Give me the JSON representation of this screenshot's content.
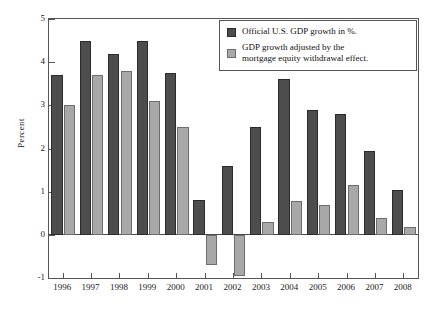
{
  "chart_data": {
    "type": "bar",
    "title": "",
    "xlabel": "",
    "ylabel": "Percent",
    "ylim": [
      -1,
      5
    ],
    "yticks": [
      -1,
      0,
      1,
      2,
      3,
      4,
      5
    ],
    "ytick_labels": [
      "-1",
      "0",
      "1",
      "2",
      "3",
      "4",
      "5"
    ],
    "grid": false,
    "legend_position": "top-right",
    "categories": [
      "1996",
      "1997",
      "1998",
      "1999",
      "2000",
      "2001",
      "2002",
      "2003",
      "2004",
      "2005",
      "2006",
      "2007",
      "2008"
    ],
    "series": [
      {
        "name": "Official U.S. GDP growth in %.",
        "color": "#4d4d4d",
        "values": [
          3.7,
          4.5,
          4.2,
          4.5,
          3.75,
          0.8,
          1.6,
          2.5,
          3.6,
          2.9,
          2.8,
          1.95,
          1.05
        ]
      },
      {
        "name": "GDP growth adjusted by the mortgage equity withdrawal effect.",
        "color": "#a8a8a8",
        "values": [
          3.0,
          3.7,
          3.8,
          3.1,
          2.5,
          -0.7,
          -0.95,
          0.3,
          0.78,
          0.68,
          1.15,
          0.38,
          0.17
        ]
      }
    ]
  },
  "legend": {
    "entries": [
      {
        "label": "Official U.S. GDP growth in %.",
        "swatch": "dark-gray-swatch"
      },
      {
        "label_line1": "GDP growth adjusted by the",
        "label_line2": "mortgage equity withdrawal effect.",
        "swatch": "light-gray-swatch"
      }
    ]
  },
  "axes": {
    "y_axis_title": "Percent"
  }
}
